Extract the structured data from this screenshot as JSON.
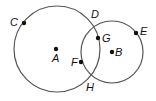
{
  "diagram": {
    "type": "two-intersecting-circles",
    "circles": [
      {
        "name": "circle-A",
        "center": "A",
        "cx": 57,
        "cy": 49,
        "r": 43
      },
      {
        "name": "circle-B",
        "center": "B",
        "cx": 112,
        "cy": 52,
        "r": 31
      }
    ],
    "points": [
      {
        "id": "A",
        "label": "A",
        "x": 56,
        "y": 49,
        "dot": true,
        "lx": 52,
        "ly": 62
      },
      {
        "id": "B",
        "label": "B",
        "x": 112,
        "y": 52,
        "dot": true,
        "lx": 115,
        "ly": 56
      },
      {
        "id": "C",
        "label": "C",
        "x": 24,
        "y": 23,
        "dot": true,
        "lx": 10,
        "ly": 26
      },
      {
        "id": "D",
        "label": "D",
        "x": 92,
        "y": 21,
        "dot": false,
        "lx": 91,
        "ly": 18
      },
      {
        "id": "E",
        "label": "E",
        "x": 136,
        "y": 33,
        "dot": true,
        "lx": 140,
        "ly": 35
      },
      {
        "id": "F",
        "label": "F",
        "x": 81,
        "y": 62,
        "dot": true,
        "lx": 71,
        "ly": 66
      },
      {
        "id": "G",
        "label": "G",
        "x": 98,
        "y": 38,
        "dot": true,
        "lx": 102,
        "ly": 42
      },
      {
        "id": "H",
        "label": "H",
        "x": 89,
        "y": 77,
        "dot": false,
        "lx": 86,
        "ly": 91
      }
    ],
    "colors": {
      "stroke": "#555555",
      "dot": "#111111",
      "background": "#ffffff"
    }
  }
}
